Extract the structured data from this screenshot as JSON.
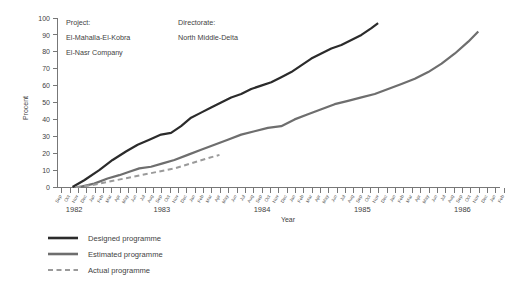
{
  "chart_data": {
    "type": "line",
    "title": "",
    "xlabel": "Year",
    "ylabel": "Procent",
    "ylim": [
      0,
      100
    ],
    "ytick_values": [
      0,
      10,
      20,
      30,
      40,
      50,
      60,
      70,
      80,
      90,
      100
    ],
    "grid": false,
    "legend_position": "below-left",
    "xlim_months": [
      0,
      53
    ],
    "year_labels": [
      "1982",
      "1983",
      "1984",
      "1985",
      "1986"
    ],
    "year_label_month_positions": [
      2,
      12.5,
      24.5,
      36.5,
      48.5
    ],
    "xtick_labels": [
      "Sep",
      "Oct",
      "Nov",
      "Dec",
      "Jan",
      "Feb",
      "Mar",
      "Apr",
      "May",
      "Jun",
      "Jul",
      "Aug",
      "Sep",
      "Oct",
      "Nov",
      "Dec",
      "Jan",
      "Feb",
      "Mar",
      "Apr",
      "May",
      "Jun",
      "Jul",
      "Aug",
      "Sep",
      "Oct",
      "Nov",
      "Dec",
      "Jan",
      "Feb",
      "Mar",
      "Apr",
      "May",
      "Jun",
      "Jul",
      "Aug",
      "Sep",
      "Oct",
      "Nov",
      "Dec",
      "Jan",
      "Feb",
      "Mar",
      "Apr",
      "May",
      "Jun",
      "Jul",
      "Aug",
      "Sep",
      "Oct",
      "Nov",
      "Dec",
      "Jan",
      "Feb"
    ],
    "series": [
      {
        "name": "Designed programme",
        "color": "#2b2b2b",
        "style": "solid",
        "width": 2.2,
        "x": [
          1.8,
          3.2,
          5.0,
          6.6,
          8.2,
          9.6,
          11.0,
          12.4,
          13.6,
          14.8,
          16.0,
          17.2,
          18.4,
          19.6,
          20.8,
          22.0,
          23.2,
          24.4,
          25.6,
          26.8,
          28.0,
          29.2,
          30.4,
          31.6,
          32.8,
          34.0,
          35.2,
          36.4,
          37.6,
          38.4
        ],
        "values": [
          0,
          4,
          10,
          16,
          21,
          25,
          28,
          31,
          32,
          36,
          41,
          44,
          47,
          50,
          53,
          55,
          58,
          60,
          62,
          65,
          68,
          72,
          76,
          79,
          82,
          84,
          87,
          90,
          94,
          97
        ]
      },
      {
        "name": "Estimated programme",
        "color": "#6e6e6e",
        "style": "solid",
        "width": 2.2,
        "x": [
          2.6,
          4.4,
          6.0,
          7.4,
          8.6,
          9.8,
          11.2,
          12.6,
          14.0,
          15.6,
          17.2,
          18.8,
          20.4,
          22.0,
          23.6,
          25.2,
          26.8,
          28.4,
          30.0,
          31.6,
          33.2,
          34.8,
          36.4,
          38.0,
          39.6,
          41.2,
          42.8,
          44.4,
          46.0,
          47.6,
          49.2,
          50.4
        ],
        "values": [
          0,
          2,
          5,
          7,
          9,
          11,
          12,
          14,
          16,
          19,
          22,
          25,
          28,
          31,
          33,
          35,
          36,
          40,
          43,
          46,
          49,
          51,
          53,
          55,
          58,
          61,
          64,
          68,
          73,
          79,
          86,
          92
        ]
      },
      {
        "name": "Actual programme",
        "color": "#9a9a9a",
        "style": "dashed",
        "width": 2.0,
        "x": [
          2.2,
          4.0,
          6.0,
          8.0,
          10.0,
          12.0,
          14.0,
          16.0,
          18.0,
          19.4
        ],
        "values": [
          0,
          1,
          3,
          5,
          7,
          9,
          11,
          14,
          17,
          19
        ]
      }
    ]
  },
  "annotations": {
    "project_label": "Project:",
    "project_name_line1": "El-Mahalla-El-Kobra",
    "project_name_line2": "El-Nasr Company",
    "directorate_label": "Directorate:",
    "directorate_name": "North Middle-Delta"
  },
  "legend": {
    "items": [
      {
        "label": "Designed programme",
        "color": "#2b2b2b",
        "style": "solid"
      },
      {
        "label": "Estimated programme",
        "color": "#6e6e6e",
        "style": "solid"
      },
      {
        "label": "Actual programme",
        "color": "#9a9a9a",
        "style": "dashed"
      }
    ]
  }
}
